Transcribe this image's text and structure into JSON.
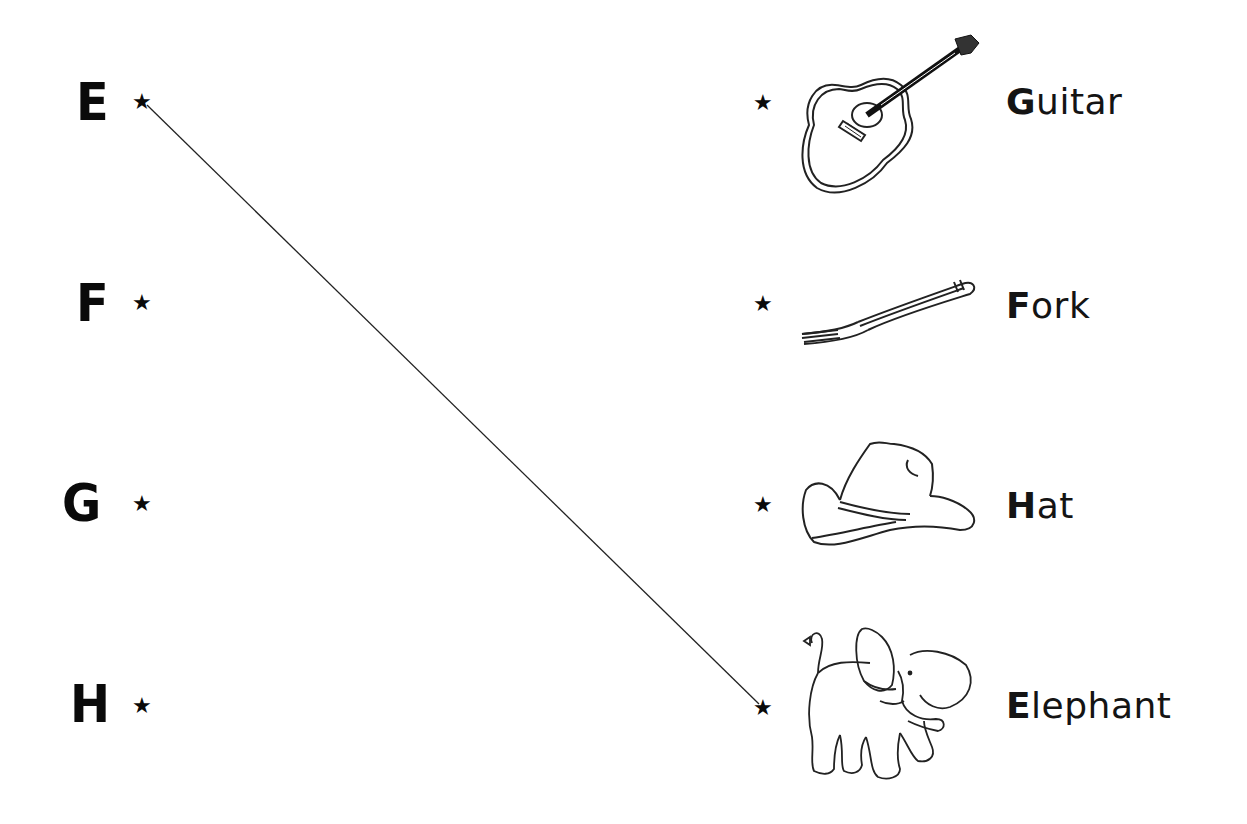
{
  "worksheet": {
    "left_column": [
      {
        "letter": "E",
        "star": "★"
      },
      {
        "letter": "F",
        "star": "★"
      },
      {
        "letter": "G",
        "star": "★"
      },
      {
        "letter": "H",
        "star": "★"
      }
    ],
    "right_column": [
      {
        "star": "★",
        "image": "guitar-drawing",
        "word_first": "G",
        "word_rest": "uitar"
      },
      {
        "star": "★",
        "image": "fork-drawing",
        "word_first": "F",
        "word_rest": "ork"
      },
      {
        "star": "★",
        "image": "hat-drawing",
        "word_first": "H",
        "word_rest": "at"
      },
      {
        "star": "★",
        "image": "elephant-drawing",
        "word_first": "E",
        "word_rest": "lephant"
      }
    ],
    "connections": [
      {
        "from": "E",
        "to": "Elephant"
      }
    ]
  }
}
